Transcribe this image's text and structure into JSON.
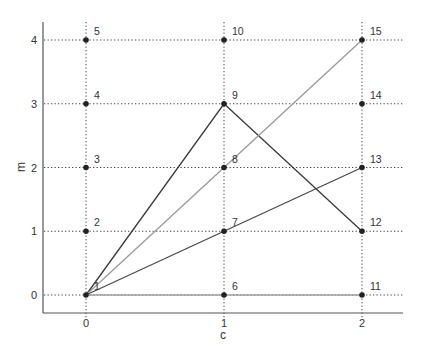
{
  "diagram": {
    "xlabel": "c",
    "ylabel": "m",
    "x_ticks": [
      "0",
      "1",
      "2"
    ],
    "y_ticks": [
      "0",
      "1",
      "2",
      "3",
      "4"
    ],
    "points": [
      {
        "id": "1",
        "c": 0,
        "m": 0
      },
      {
        "id": "2",
        "c": 0,
        "m": 1
      },
      {
        "id": "3",
        "c": 0,
        "m": 2
      },
      {
        "id": "4",
        "c": 0,
        "m": 3
      },
      {
        "id": "5",
        "c": 0,
        "m": 4
      },
      {
        "id": "6",
        "c": 1,
        "m": 0
      },
      {
        "id": "7",
        "c": 1,
        "m": 1
      },
      {
        "id": "8",
        "c": 1,
        "m": 2
      },
      {
        "id": "9",
        "c": 1,
        "m": 3
      },
      {
        "id": "10",
        "c": 1,
        "m": 4
      },
      {
        "id": "11",
        "c": 2,
        "m": 0
      },
      {
        "id": "12",
        "c": 2,
        "m": 1
      },
      {
        "id": "13",
        "c": 2,
        "m": 2
      },
      {
        "id": "14",
        "c": 2,
        "m": 3
      },
      {
        "id": "15",
        "c": 2,
        "m": 4
      }
    ],
    "paths": [
      {
        "name": "path-1-9-12",
        "nodes": [
          "1",
          "9",
          "12"
        ],
        "color": "#3a3a3a"
      },
      {
        "name": "path-1-15",
        "nodes": [
          "1",
          "15"
        ],
        "color": "#9a9a9a"
      },
      {
        "name": "path-1-13",
        "nodes": [
          "1",
          "13"
        ],
        "color": "#4a4a4a"
      },
      {
        "name": "path-1-11",
        "nodes": [
          "1",
          "11"
        ],
        "color": "#a0a0a0"
      }
    ],
    "colors": {
      "axis": "#555555",
      "grid": "#444444",
      "point": "#222222",
      "text": "#333333"
    }
  }
}
